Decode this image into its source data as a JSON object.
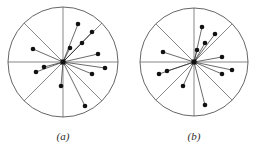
{
  "figure": {
    "kind": "two-panel-circular-radial-scatter",
    "background_color": "#ffffff",
    "stroke_color": "#555555",
    "point_color": "#111111",
    "hub_color": "#111111",
    "label_color": "#2b2b2b",
    "width": 260,
    "height": 151
  },
  "chart_data": {
    "type": "scatter",
    "title": "",
    "subtitle": "",
    "xlabel": "",
    "ylabel": "",
    "grid": false,
    "legend": null,
    "coordinate_system": "polar",
    "panels": [
      {
        "id": "a",
        "label": "(a)",
        "label_x": 63,
        "label_y": 140,
        "circle": {
          "cx": 63,
          "cy": 62,
          "r": 55
        },
        "hub": {
          "cx": 63,
          "cy": 62,
          "size": 5
        },
        "sector_lines": [
          {
            "angle_deg": 90
          },
          {
            "angle_deg": 270
          },
          {
            "angle_deg": 180
          },
          {
            "angle_deg": 0
          },
          {
            "angle_deg": 135
          },
          {
            "angle_deg": 45
          },
          {
            "angle_deg": 225
          },
          {
            "angle_deg": 315
          }
        ],
        "points": [
          {
            "x": 78,
            "y": 24
          },
          {
            "x": 92,
            "y": 32
          },
          {
            "x": 82,
            "y": 43
          },
          {
            "x": 70,
            "y": 48
          },
          {
            "x": 98,
            "y": 54
          },
          {
            "x": 33,
            "y": 49
          },
          {
            "x": 105,
            "y": 68
          },
          {
            "x": 92,
            "y": 74
          },
          {
            "x": 44,
            "y": 67
          },
          {
            "x": 36,
            "y": 72
          },
          {
            "x": 61,
            "y": 86
          },
          {
            "x": 85,
            "y": 106
          }
        ],
        "point_count": 12
      },
      {
        "id": "b",
        "label": "(b)",
        "label_x": 194,
        "label_y": 140,
        "circle": {
          "cx": 194,
          "cy": 62,
          "r": 54
        },
        "hub": {
          "cx": 194,
          "cy": 62,
          "size": 5
        },
        "sector_lines": [
          {
            "angle_deg": 90
          },
          {
            "angle_deg": 270
          },
          {
            "angle_deg": 180
          },
          {
            "angle_deg": 0
          },
          {
            "angle_deg": 135
          },
          {
            "angle_deg": 45
          },
          {
            "angle_deg": 225
          },
          {
            "angle_deg": 315
          }
        ],
        "points": [
          {
            "x": 202,
            "y": 27
          },
          {
            "x": 215,
            "y": 34
          },
          {
            "x": 205,
            "y": 43
          },
          {
            "x": 197,
            "y": 50
          },
          {
            "x": 222,
            "y": 57
          },
          {
            "x": 163,
            "y": 52
          },
          {
            "x": 232,
            "y": 70
          },
          {
            "x": 222,
            "y": 74
          },
          {
            "x": 167,
            "y": 71
          },
          {
            "x": 159,
            "y": 74
          },
          {
            "x": 183,
            "y": 86
          },
          {
            "x": 205,
            "y": 105
          }
        ],
        "point_count": 12
      }
    ]
  }
}
